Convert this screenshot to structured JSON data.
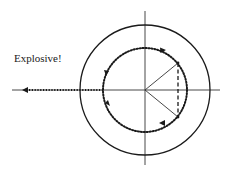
{
  "diagram": {
    "type": "phasor / unit-circle diagram",
    "annotation": "Explosive!",
    "colors": {
      "stroke": "#1a1a1a",
      "axis": "#333333",
      "background": "#ffffff"
    },
    "geometry": {
      "center": [
        145,
        90
      ],
      "outer_circle_radius": 65,
      "inner_dotted_circle_radius": 42,
      "vertical_axis": {
        "x": 145,
        "y1": 11,
        "y2": 165
      },
      "horizontal_axis": {
        "y": 90,
        "x1": 12,
        "x2": 220
      },
      "radius_upper_end": [
        178,
        63
      ],
      "radius_lower_end": [
        178,
        117
      ],
      "dashed_chord_x": 178,
      "explosive_arrow": {
        "from": [
          103,
          90
        ],
        "to": [
          22,
          90
        ]
      }
    },
    "elements": [
      "outer solid circle",
      "vertical axis line",
      "horizontal axis line",
      "inner dotted circle with directional arrowheads",
      "two solid radii to upper and lower points on inner circle",
      "dashed vertical chord between radii endpoints",
      "dotted leftward arrow labeled Explosive!"
    ]
  }
}
